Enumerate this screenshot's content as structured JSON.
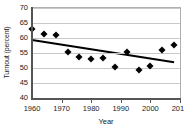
{
  "chart_data": {
    "type": "scatter",
    "title": "",
    "xlabel": "Year",
    "ylabel": "Turnout (percent)",
    "xlim": [
      1960,
      2010
    ],
    "ylim": [
      40,
      70
    ],
    "xticks": [
      1960,
      1970,
      1980,
      1990,
      2000,
      2010
    ],
    "xtick_labels": [
      "1960",
      "1970",
      "1980",
      "1990",
      "2000",
      "2010"
    ],
    "yticks": [
      40,
      45,
      50,
      55,
      60,
      65,
      70
    ],
    "ytick_labels": [
      "40",
      "45",
      "50",
      "55",
      "60",
      "65",
      "70"
    ],
    "grid": "horizontal",
    "legend": "none",
    "marker_style": "filled-diamond",
    "marker_color": "#000000",
    "x": [
      1960,
      1964,
      1968,
      1972,
      1976,
      1980,
      1984,
      1988,
      1992,
      1996,
      2000,
      2004,
      2008
    ],
    "values": [
      63.1,
      61.3,
      60.9,
      55.2,
      53.7,
      52.9,
      53.4,
      50.4,
      55.5,
      49.4,
      50.6,
      56.1,
      57.7
    ],
    "series": [
      {
        "name": "Turnout (percent)",
        "x": [
          1960,
          1964,
          1968,
          1972,
          1976,
          1980,
          1984,
          1988,
          1992,
          1996,
          2000,
          2004,
          2008
        ],
        "values": [
          63.1,
          61.3,
          60.9,
          55.2,
          53.7,
          52.9,
          53.4,
          50.4,
          55.5,
          49.4,
          50.6,
          56.1,
          57.7
        ]
      },
      {
        "name": "linear trend",
        "type": "line",
        "color": "#000000",
        "x": [
          1960,
          2008
        ],
        "values": [
          59.3,
          51.9
        ]
      }
    ],
    "trendline": {
      "x_start": 1960,
      "y_start": 59.3,
      "x_end": 2008,
      "y_end": 51.9,
      "color": "#000000",
      "width": 2
    },
    "annotations": []
  }
}
